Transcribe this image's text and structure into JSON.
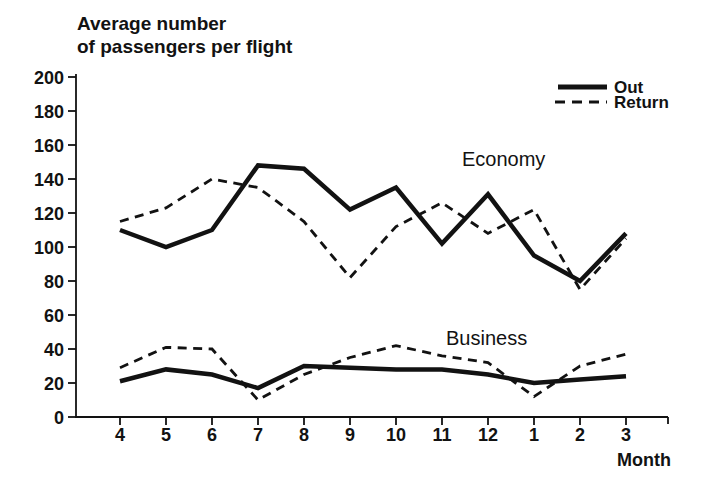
{
  "title": {
    "line1": "Average number",
    "line2": "of passengers per flight"
  },
  "legend": {
    "items": [
      {
        "label": "Out",
        "style": "solid"
      },
      {
        "label": "Return",
        "style": "dashed"
      }
    ]
  },
  "annotations": {
    "economy": "Economy",
    "business": "Business"
  },
  "colors": {
    "ink": "#121212",
    "background": "#ffffff"
  },
  "chart_data": {
    "type": "line",
    "title": "Average number of passengers per flight",
    "xlabel": "Month",
    "ylabel": "Average number of passengers per flight",
    "categories": [
      "4",
      "5",
      "6",
      "7",
      "8",
      "9",
      "10",
      "11",
      "12",
      "1",
      "2",
      "3"
    ],
    "y_ticks": [
      0,
      20,
      40,
      60,
      80,
      100,
      120,
      140,
      160,
      180,
      200
    ],
    "ylim": [
      0,
      200
    ],
    "grid": false,
    "legend_position": "top-right",
    "series": [
      {
        "name": "Economy Out",
        "group": "Economy",
        "legend": "Out",
        "style": "solid",
        "values": [
          110,
          100,
          110,
          148,
          146,
          122,
          135,
          102,
          131,
          95,
          80,
          108
        ]
      },
      {
        "name": "Economy Return",
        "group": "Economy",
        "legend": "Return",
        "style": "dashed",
        "values": [
          115,
          123,
          140,
          135,
          115,
          82,
          112,
          126,
          108,
          122,
          75,
          105
        ]
      },
      {
        "name": "Business Out",
        "group": "Business",
        "legend": "Out",
        "style": "solid",
        "values": [
          21,
          28,
          25,
          17,
          30,
          29,
          28,
          28,
          25,
          20,
          22,
          24
        ]
      },
      {
        "name": "Business Return",
        "group": "Business",
        "legend": "Return",
        "style": "dashed",
        "values": [
          29,
          41,
          40,
          10,
          25,
          35,
          42,
          36,
          32,
          12,
          30,
          37
        ]
      }
    ]
  }
}
